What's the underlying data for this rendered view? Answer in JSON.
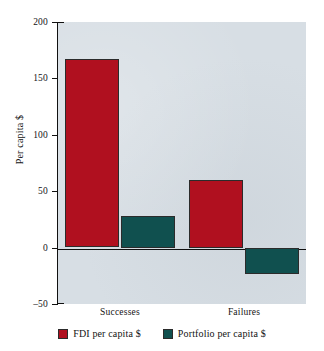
{
  "chart_data": {
    "type": "bar",
    "title": "",
    "subtitle": "",
    "xlabel": "",
    "ylabel": "Per capita $",
    "categories": [
      "Successes",
      "Failures"
    ],
    "series": [
      {
        "name": "FDI per capita $",
        "color": "#b0101f",
        "values": [
          167,
          60
        ]
      },
      {
        "name": "Portfolio per capita $",
        "color": "#10504f",
        "values": [
          28,
          -23
        ]
      }
    ],
    "ylim": [
      -50,
      200
    ],
    "yticks": [
      200,
      150,
      100,
      50,
      0,
      -50
    ],
    "ytick_labels": [
      "200",
      "150",
      "100",
      "50",
      "0",
      "–50"
    ],
    "grid": false,
    "legend_position": "bottom",
    "plot_background": "#d7dee4",
    "page_background": "#ffffff",
    "axis_color": "#111111"
  },
  "axis": {
    "y_title": "Per capita $",
    "ticks": [
      {
        "label": "200",
        "value": 200
      },
      {
        "label": "150",
        "value": 150
      },
      {
        "label": "100",
        "value": 100
      },
      {
        "label": "50",
        "value": 50
      },
      {
        "label": "0",
        "value": 0
      },
      {
        "label": "–50",
        "value": -50
      }
    ]
  },
  "x_labels": [
    "Successes",
    "Failures"
  ],
  "legend": {
    "items": [
      {
        "label": "FDI per capita $",
        "color": "#b0101f"
      },
      {
        "label": "Portfolio per capita $",
        "color": "#10504f"
      }
    ]
  }
}
